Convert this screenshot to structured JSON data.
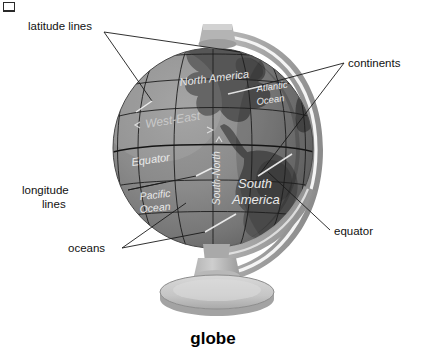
{
  "figure": {
    "caption": "globe",
    "corner_mark": "crop-mark"
  },
  "callouts": [
    {
      "id": "latitude-lines",
      "label_line1": "latitude lines",
      "label_line2": ""
    },
    {
      "id": "continents",
      "label_line1": "continents",
      "label_line2": ""
    },
    {
      "id": "longitude-lines",
      "label_line1": "longitude",
      "label_line2": "lines"
    },
    {
      "id": "oceans",
      "label_line1": "oceans",
      "label_line2": ""
    },
    {
      "id": "equator",
      "label_line1": "equator",
      "label_line2": ""
    }
  ],
  "globe_labels": {
    "north_america": "North America",
    "south_america_line1": "South",
    "south_america_line2": "America",
    "atlantic_line1": "Atlantic",
    "atlantic_line2": "Ocean",
    "pacific_line1": "Pacific",
    "pacific_line2": "Ocean",
    "equator": "Equator",
    "west_east": "West-East",
    "south_north": "South-North"
  },
  "colors": {
    "background": "#ffffff",
    "ocean": "#8d8d8d",
    "ocean_shadow": "#6f6f6f",
    "land": "#585858",
    "land_dark": "#474747",
    "ring": "#a8a8a8",
    "ring_light": "#c9c9c9",
    "ring_dark": "#8a8a8a",
    "base": "#cfcfcf",
    "base_dark": "#9e9e9e",
    "text": "#111111",
    "map_text": "#e9e9e9",
    "gridline": "#1d1d1d"
  }
}
